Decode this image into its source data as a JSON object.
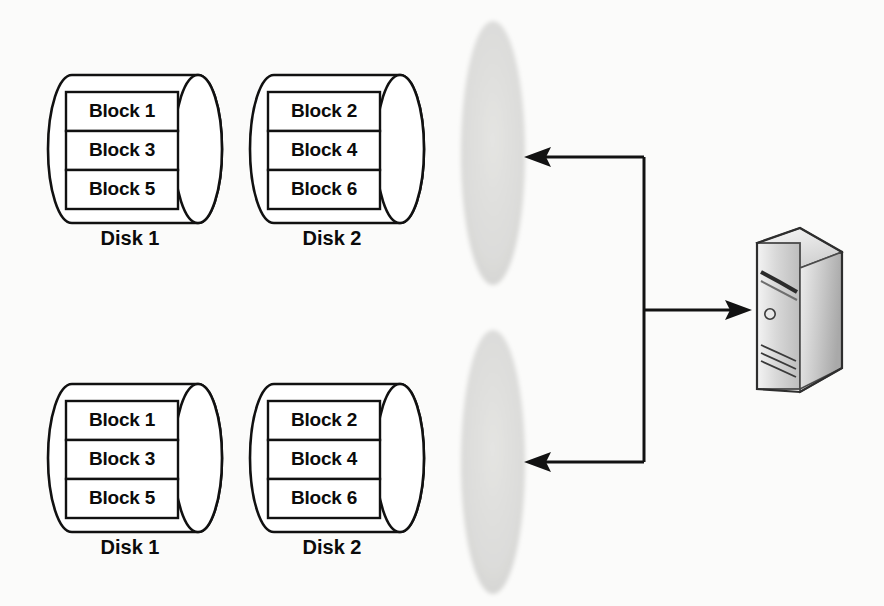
{
  "diagram": {
    "background_color": "#fbfbfa",
    "line_color": "#121212",
    "volume_fill_color": "#dededc",
    "disk_fill_color": "#ffffff"
  },
  "arrays": [
    {
      "id": "array-top",
      "disks": [
        {
          "label": "Disk 1",
          "blocks": [
            "Block 1",
            "Block 3",
            "Block 5"
          ]
        },
        {
          "label": "Disk 2",
          "blocks": [
            "Block 2",
            "Block 4",
            "Block 6"
          ]
        }
      ],
      "volume": {
        "name": "volume-ellipse",
        "fill": "#dededc"
      }
    },
    {
      "id": "array-bottom",
      "disks": [
        {
          "label": "Disk 1",
          "blocks": [
            "Block 1",
            "Block 3",
            "Block 5"
          ]
        },
        {
          "label": "Disk 2",
          "blocks": [
            "Block 2",
            "Block 4",
            "Block 6"
          ]
        }
      ],
      "volume": {
        "name": "volume-ellipse",
        "fill": "#dededc"
      }
    }
  ],
  "server": {
    "name": "server-tower-icon",
    "label": "",
    "body_color": "#b8b8b8",
    "front_color": "#d4d4d4",
    "top_color": "#efefef"
  },
  "connectors": [
    {
      "name": "connector-to-top-volume",
      "direction": "left"
    },
    {
      "name": "connector-to-bottom-volume",
      "direction": "left"
    },
    {
      "name": "connector-to-server",
      "direction": "right"
    }
  ]
}
